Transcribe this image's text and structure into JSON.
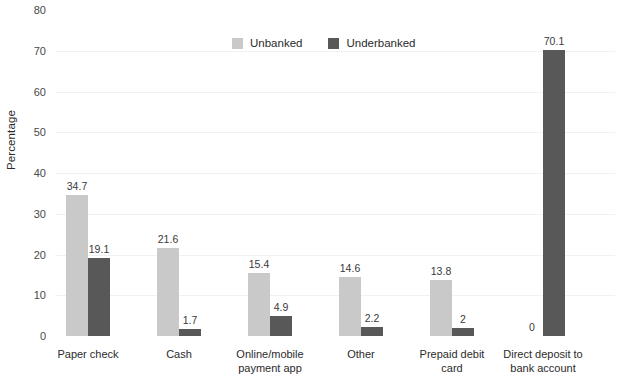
{
  "chart_data": {
    "type": "bar",
    "title": "",
    "subtitle": "",
    "xlabel": "",
    "ylabel": "Percentage",
    "ylim": [
      0,
      80
    ],
    "ytick_step": 10,
    "yticks": [
      "0",
      "10",
      "20",
      "30",
      "40",
      "50",
      "60",
      "70",
      "80"
    ],
    "grid": true,
    "legend_position": "top-center",
    "categories": [
      "Paper check",
      "Cash",
      "Online/mobile payment app",
      "Other",
      "Prepaid debit card",
      "Direct deposit to bank account"
    ],
    "series": [
      {
        "name": "Unbanked",
        "color": "#c9c9c9",
        "values": [
          34.7,
          21.6,
          15.4,
          14.6,
          13.8,
          0
        ],
        "labels": [
          "34.7",
          "21.6",
          "15.4",
          "14.6",
          "13.8",
          "0"
        ]
      },
      {
        "name": "Underbanked",
        "color": "#585858",
        "values": [
          19.1,
          1.7,
          4.9,
          2.2,
          2,
          70.1
        ],
        "labels": [
          "19.1",
          "1.7",
          "4.9",
          "2.2",
          "2",
          "70.1"
        ]
      }
    ]
  },
  "axis": {
    "y_title": "Percentage"
  },
  "legend": {
    "items": [
      {
        "label": "Unbanked",
        "color": "#c9c9c9"
      },
      {
        "label": "Underbanked",
        "color": "#585858"
      }
    ]
  },
  "x_labels": [
    {
      "line1": "Paper check",
      "line2": ""
    },
    {
      "line1": "Cash",
      "line2": ""
    },
    {
      "line1": "Online/mobile",
      "line2": "payment app"
    },
    {
      "line1": "Other",
      "line2": ""
    },
    {
      "line1": "Prepaid debit",
      "line2": "card"
    },
    {
      "line1": "Direct deposit to",
      "line2": "bank account"
    }
  ],
  "colors": {
    "unbanked": "#c9c9c9",
    "underbanked": "#585858",
    "gridline": "#f1f1f1",
    "text": "#2b2b2b",
    "background": "#ffffff"
  }
}
